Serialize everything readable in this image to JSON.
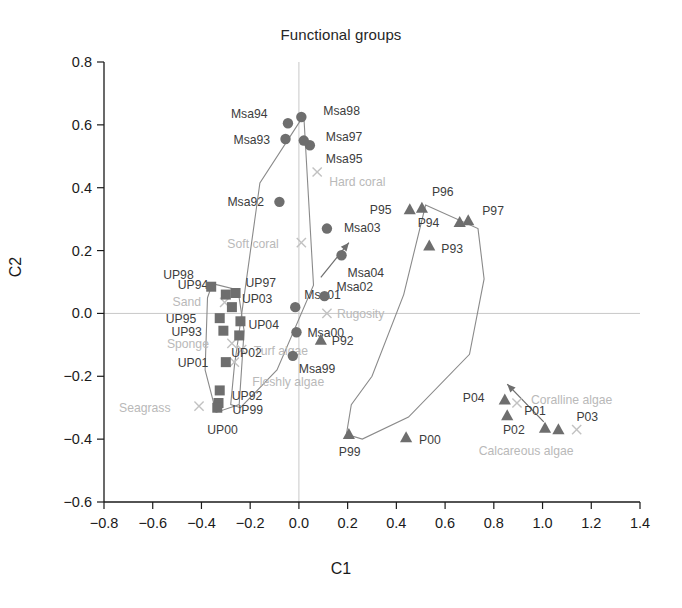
{
  "chart_data": {
    "type": "scatter",
    "title": "Functional groups",
    "xlabel": "C1",
    "ylabel": "C2",
    "xlim": [
      -0.8,
      1.4
    ],
    "ylim": [
      -0.6,
      0.8
    ],
    "xticks": [
      "-0.8",
      "-0.6",
      "-0.4",
      "-0.2",
      "0.0",
      "0.2",
      "0.4",
      "0.6",
      "0.8",
      "1.0",
      "1.2",
      "1.4"
    ],
    "xtick_values": [
      -0.8,
      -0.6,
      -0.4,
      -0.2,
      0.0,
      0.2,
      0.4,
      0.6,
      0.8,
      1.0,
      1.2,
      1.4
    ],
    "yticks": [
      "0.8",
      "0.6",
      "0.4",
      "0.2",
      "0.0",
      "-0.2",
      "-0.4",
      "-0.6"
    ],
    "ytick_values": [
      0.8,
      0.6,
      0.4,
      0.2,
      0.0,
      -0.2,
      -0.4,
      -0.6
    ],
    "grid": false,
    "zero_lines": true,
    "legend": "none",
    "series": [
      {
        "name": "Msa",
        "marker": "circle",
        "color": "#6e6e6e",
        "points": [
          {
            "label": "Msa92",
            "x": -0.08,
            "y": 0.355,
            "label_dx": -52,
            "label_dy": 4
          },
          {
            "label": "Msa93",
            "x": -0.055,
            "y": 0.555,
            "label_dx": -52,
            "label_dy": 5
          },
          {
            "label": "Msa94",
            "x": -0.045,
            "y": 0.605,
            "label_dx": -57,
            "label_dy": -5
          },
          {
            "label": "Msa95",
            "x": 0.045,
            "y": 0.535,
            "label_dx": 16,
            "label_dy": 18
          },
          {
            "label": "Msa97",
            "x": 0.02,
            "y": 0.55,
            "label_dx": 22,
            "label_dy": 0
          },
          {
            "label": "Msa98",
            "x": 0.01,
            "y": 0.625,
            "label_dx": 22,
            "label_dy": -2
          },
          {
            "label": "Msa99",
            "x": -0.025,
            "y": -0.135,
            "label_dx": 6,
            "label_dy": 17
          },
          {
            "label": "Msa00",
            "x": -0.01,
            "y": -0.06,
            "label_dx": 11,
            "label_dy": 5
          },
          {
            "label": "Msa01",
            "x": -0.015,
            "y": 0.02,
            "label_dx": 9,
            "label_dy": -8
          },
          {
            "label": "Msa02",
            "x": 0.105,
            "y": 0.055,
            "label_dx": 12,
            "label_dy": -5
          },
          {
            "label": "Msa03",
            "x": 0.115,
            "y": 0.27,
            "label_dx": 17,
            "label_dy": 3
          },
          {
            "label": "Msa04",
            "x": 0.175,
            "y": 0.185,
            "label_dx": 6,
            "label_dy": 22
          }
        ]
      },
      {
        "name": "UP",
        "marker": "square",
        "color": "#6e6e6e",
        "points": [
          {
            "label": "UP92",
            "x": -0.325,
            "y": -0.245,
            "label_dx": 12,
            "label_dy": 10
          },
          {
            "label": "UP93",
            "x": -0.31,
            "y": -0.055,
            "label_dx": -52,
            "label_dy": 5
          },
          {
            "label": "UP94",
            "x": -0.3,
            "y": 0.06,
            "label_dx": -48,
            "label_dy": -6
          },
          {
            "label": "UP95",
            "x": -0.325,
            "y": -0.015,
            "label_dx": -54,
            "label_dy": 5
          },
          {
            "label": "UP97",
            "x": -0.26,
            "y": 0.065,
            "label_dx": 10,
            "label_dy": -6
          },
          {
            "label": "UP99",
            "x": -0.33,
            "y": -0.285,
            "label_dx": 14,
            "label_dy": 11
          },
          {
            "label": "UP00",
            "x": -0.335,
            "y": -0.3,
            "label_dx": -10,
            "label_dy": 26
          },
          {
            "label": "UP01",
            "x": -0.3,
            "y": -0.155,
            "label_dx": -48,
            "label_dy": 5
          },
          {
            "label": "UP02",
            "x": -0.245,
            "y": -0.07,
            "label_dx": -8,
            "label_dy": 22
          },
          {
            "label": "UP03",
            "x": -0.275,
            "y": 0.02,
            "label_dx": 10,
            "label_dy": -4
          },
          {
            "label": "UP04",
            "x": -0.24,
            "y": -0.025,
            "label_dx": 8,
            "label_dy": 8
          },
          {
            "label": "UP98",
            "x": -0.36,
            "y": 0.085,
            "label_dx": -48,
            "label_dy": -8
          }
        ]
      },
      {
        "name": "P",
        "marker": "triangle",
        "color": "#6e6e6e",
        "points": [
          {
            "label": "P92",
            "x": 0.09,
            "y": -0.085,
            "label_dx": 11,
            "label_dy": 5
          },
          {
            "label": "P93",
            "x": 0.535,
            "y": 0.215,
            "label_dx": 12,
            "label_dy": 7
          },
          {
            "label": "P94",
            "x": 0.66,
            "y": 0.29,
            "label_dx": -42,
            "label_dy": 5
          },
          {
            "label": "P95",
            "x": 0.455,
            "y": 0.33,
            "label_dx": -40,
            "label_dy": 4
          },
          {
            "label": "P96",
            "x": 0.505,
            "y": 0.335,
            "label_dx": 10,
            "label_dy": -12
          },
          {
            "label": "P97",
            "x": 0.695,
            "y": 0.295,
            "label_dx": 14,
            "label_dy": -6
          },
          {
            "label": "P99",
            "x": 0.205,
            "y": -0.385,
            "label_dx": -10,
            "label_dy": 22
          },
          {
            "label": "P00",
            "x": 0.44,
            "y": -0.395,
            "label_dx": 13,
            "label_dy": 6
          },
          {
            "label": "P01",
            "x": 0.855,
            "y": -0.325,
            "label_dx": 17,
            "label_dy": -1
          },
          {
            "label": "P02",
            "x": 1.01,
            "y": -0.365,
            "label_dx": -42,
            "label_dy": 6
          },
          {
            "label": "P03",
            "x": 1.065,
            "y": -0.37,
            "label_dx": 18,
            "label_dy": -9
          },
          {
            "label": "P04",
            "x": 0.845,
            "y": -0.275,
            "label_dx": -42,
            "label_dy": 2
          }
        ]
      }
    ],
    "environmental_variables": [
      {
        "label": "Hard coral",
        "x": 0.075,
        "y": 0.45,
        "label_dx": 12,
        "label_dy": 14
      },
      {
        "label": "Soft coral",
        "x": 0.01,
        "y": 0.225,
        "label_dx": -74,
        "label_dy": 5
      },
      {
        "label": "Rugosity",
        "x": 0.115,
        "y": 0.0,
        "label_dx": 10,
        "label_dy": 5
      },
      {
        "label": "Sand",
        "x": -0.305,
        "y": 0.035,
        "label_dx": -52,
        "label_dy": 0
      },
      {
        "label": "Sponge",
        "x": -0.275,
        "y": -0.095,
        "label_dx": -65,
        "label_dy": 5
      },
      {
        "label": "Turf algae",
        "x": -0.235,
        "y": -0.115,
        "label_dx": 12,
        "label_dy": 5
      },
      {
        "label": "Fleshly algae",
        "x": -0.265,
        "y": -0.155,
        "label_dx": 18,
        "label_dy": 24
      },
      {
        "label": "Seagrass",
        "x": -0.41,
        "y": -0.295,
        "label_dx": -80,
        "label_dy": 6
      },
      {
        "label": "Coralline algae",
        "x": 0.895,
        "y": -0.285,
        "label_dx": 14,
        "label_dy": 1
      },
      {
        "label": "Calcareous algae",
        "x": 1.14,
        "y": -0.37,
        "label_dx": -98,
        "label_dy": 25
      }
    ],
    "hulls": [
      {
        "name": "Msa-hull",
        "path": "M 0.02 0.63 L -0.16 0.415 L -0.265 -0.17 L -0.28 -0.29 L -0.24 -0.30 L -0.09 -0.18 L 0.06 0.09 L 0.02 0.63 Z"
      },
      {
        "name": "UP-hull",
        "path": "M -0.355 0.095 L -0.25 0.075 L -0.225 -0.055 L -0.245 -0.29 L -0.34 -0.315 L -0.385 -0.18 L -0.375 0.05 L -0.355 0.095 Z"
      },
      {
        "name": "P-hull",
        "path": "M 0.52 0.345 L 0.735 0.27 L 0.76 0.11 L 0.70 -0.13 L 0.45 -0.33 L 0.26 -0.40 L 0.195 -0.385 L 0.215 -0.29 L 0.30 -0.20 L 0.43 0.06 L 0.52 0.345 Z"
      }
    ],
    "arrows": [
      {
        "name": "msa-trajectory-arrow",
        "x1": 0.09,
        "y1": 0.115,
        "x2": 0.205,
        "y2": 0.225
      },
      {
        "name": "p-trajectory-arrow",
        "x1": 1.005,
        "y1": -0.345,
        "x2": 0.855,
        "y2": -0.225
      }
    ]
  }
}
